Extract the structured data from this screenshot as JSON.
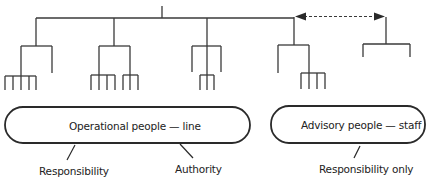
{
  "diagram": {
    "type": "organization-chart",
    "line_color": "#3a3a3a",
    "nodes": {
      "line_group": {
        "label": "Operational people — line",
        "attributes": [
          "Responsibility",
          "Authority"
        ]
      },
      "staff_group": {
        "label": "Advisory people — staff",
        "attributes": [
          "Responsibility only"
        ]
      }
    },
    "connector": {
      "style": "dashed",
      "direction": "bidirectional",
      "between": [
        "line hierarchy",
        "staff"
      ]
    }
  }
}
